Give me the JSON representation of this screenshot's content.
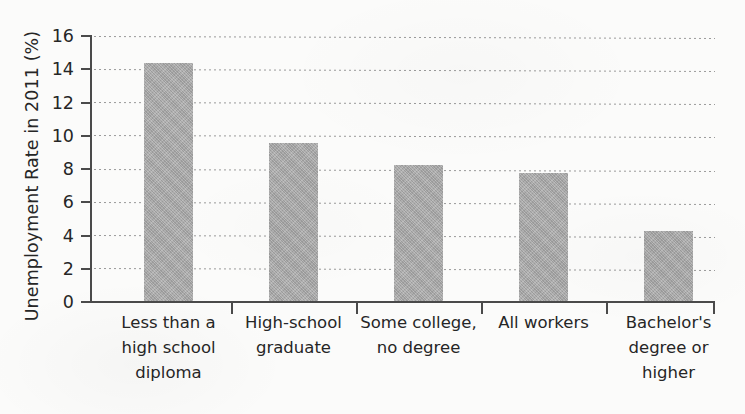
{
  "chart_data": {
    "type": "bar",
    "title": "",
    "xlabel": "",
    "ylabel": "Unemployment Rate in 2011 (%)",
    "categories": [
      "Less than a high school diploma",
      "High-school graduate",
      "Some college, no degree",
      "All workers",
      "Bachelor's degree or higher"
    ],
    "category_lines": [
      [
        "Less than a",
        "high school",
        "diploma"
      ],
      [
        "High-school",
        "graduate"
      ],
      [
        "Some college,",
        "no degree"
      ],
      [
        "All workers"
      ],
      [
        "Bachelor's",
        "degree or",
        "higher"
      ]
    ],
    "values": [
      14.3,
      9.5,
      8.2,
      7.7,
      4.2
    ],
    "ylim": [
      0,
      16
    ],
    "ytick_labels": [
      "16",
      "14",
      "12",
      "10",
      "8",
      "6",
      "4",
      "2",
      "0"
    ],
    "ytick_values": [
      16,
      14,
      12,
      10,
      8,
      6,
      4,
      2,
      0
    ],
    "grid": "horizontal-dotted",
    "legend": "none",
    "bar_color": "#a9a9a9",
    "axis_color": "#4a4a4a",
    "gridline_color": "#9a9a9a",
    "background_color": "#fbfbfa"
  }
}
